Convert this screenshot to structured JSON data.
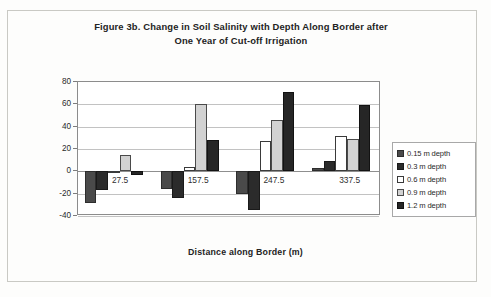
{
  "chart_data": {
    "type": "bar",
    "title": "Figure 3b. Change in Soil Salinity with Depth Along Border after One Year of Cut-off Irrigation",
    "title_line1": "Figure 3b. Change in Soil Salinity with Depth Along Border after",
    "title_line2": "One Year of Cut-off Irrigation",
    "xlabel": "Distance along Border (m)",
    "ylabel": "% Change in Soil Salinity",
    "categories": [
      "27.5",
      "157.5",
      "247.5",
      "337.5"
    ],
    "ylim": [
      -40,
      80
    ],
    "yticks": [
      "80",
      "60",
      "40",
      "20",
      "0",
      "-20",
      "-40"
    ],
    "grid": true,
    "legend_position": "right",
    "series": [
      {
        "name": "0.15 m depth",
        "color": "#4a4a4a",
        "values": [
          -28,
          -16,
          -20,
          3
        ]
      },
      {
        "name": "0.3 m depth",
        "color": "#2b2b2b",
        "values": [
          -17,
          -24,
          -35,
          9
        ]
      },
      {
        "name": "0.6 m depth",
        "color": "#ffffff",
        "values": [
          -1,
          4,
          27,
          32
        ]
      },
      {
        "name": "0.9 m depth",
        "color": "#d2d2d2",
        "values": [
          15,
          60,
          46,
          29
        ]
      },
      {
        "name": "1.2 m depth",
        "color": "#262626",
        "values": [
          -3,
          28,
          71,
          59
        ]
      }
    ]
  },
  "legend": {
    "items": [
      {
        "label": "0.15 m depth"
      },
      {
        "label": "0.3 m depth"
      },
      {
        "label": "0.6 m depth"
      },
      {
        "label": "0.9 m depth"
      },
      {
        "label": "1.2 m depth"
      }
    ]
  }
}
